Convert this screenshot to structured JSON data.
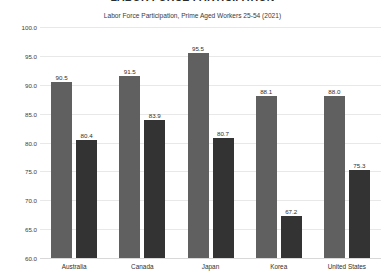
{
  "chart_data": {
    "type": "bar",
    "title": "LABOR FORCE PARTICIPATION",
    "subtitle": "Labor Force Participation, Prime Aged Workers 25-54 (2021)",
    "categories": [
      "Australia",
      "Canada",
      "Japan",
      "Korea",
      "United States"
    ],
    "series": [
      {
        "name": "series-1",
        "color": "#606060",
        "values": [
          90.5,
          91.5,
          95.5,
          88.1,
          88.0
        ]
      },
      {
        "name": "series-2",
        "color": "#333333",
        "values": [
          80.4,
          83.9,
          80.7,
          67.2,
          75.3
        ]
      }
    ],
    "value_labels": [
      [
        "90.5",
        "91.5",
        "95.5",
        "88.1",
        "88.0"
      ],
      [
        "80.4",
        "83.9",
        "80.7",
        "67.2",
        "75.3"
      ]
    ],
    "ylim": [
      60.0,
      100.0
    ],
    "yticks": [
      "100.0",
      "95.0",
      "90.0",
      "85.0",
      "80.0",
      "75.0",
      "70.0",
      "65.0",
      "60.0"
    ],
    "ytick_values": [
      100.0,
      95.0,
      90.0,
      85.0,
      80.0,
      75.0,
      70.0,
      65.0,
      60.0
    ],
    "xlabel": "",
    "ylabel": "",
    "grid": true,
    "legend": "none"
  }
}
